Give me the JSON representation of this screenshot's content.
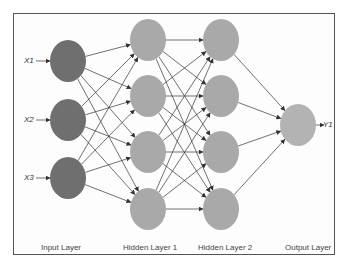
{
  "diagram": {
    "colors": {
      "input_node": "#6f6f6f",
      "hidden_node": "#a9a9a9",
      "output_node": "#b3b3b3",
      "edge": "#333333",
      "border": "#555555"
    },
    "layers": [
      {
        "label": "Input Layer",
        "x": 68,
        "nodes": [
          61,
          120,
          178
        ],
        "type": "input"
      },
      {
        "label": "Hidden Layer 1",
        "x": 148,
        "nodes": [
          40,
          96,
          152,
          209
        ],
        "type": "hidden"
      },
      {
        "label": "Hidden Layer 2",
        "x": 221,
        "nodes": [
          40,
          96,
          152,
          209
        ],
        "type": "hidden"
      },
      {
        "label": "Output Layer",
        "x": 298,
        "nodes": [
          125
        ],
        "type": "output"
      }
    ],
    "inputs": [
      "X1",
      "X2",
      "X3"
    ],
    "outputs": [
      "Y1"
    ],
    "layer_labels": {
      "input": "Input Layer",
      "hidden1": "Hidden Layer 1",
      "hidden2": "Hidden Layer 2",
      "output": "Output Layer"
    }
  }
}
